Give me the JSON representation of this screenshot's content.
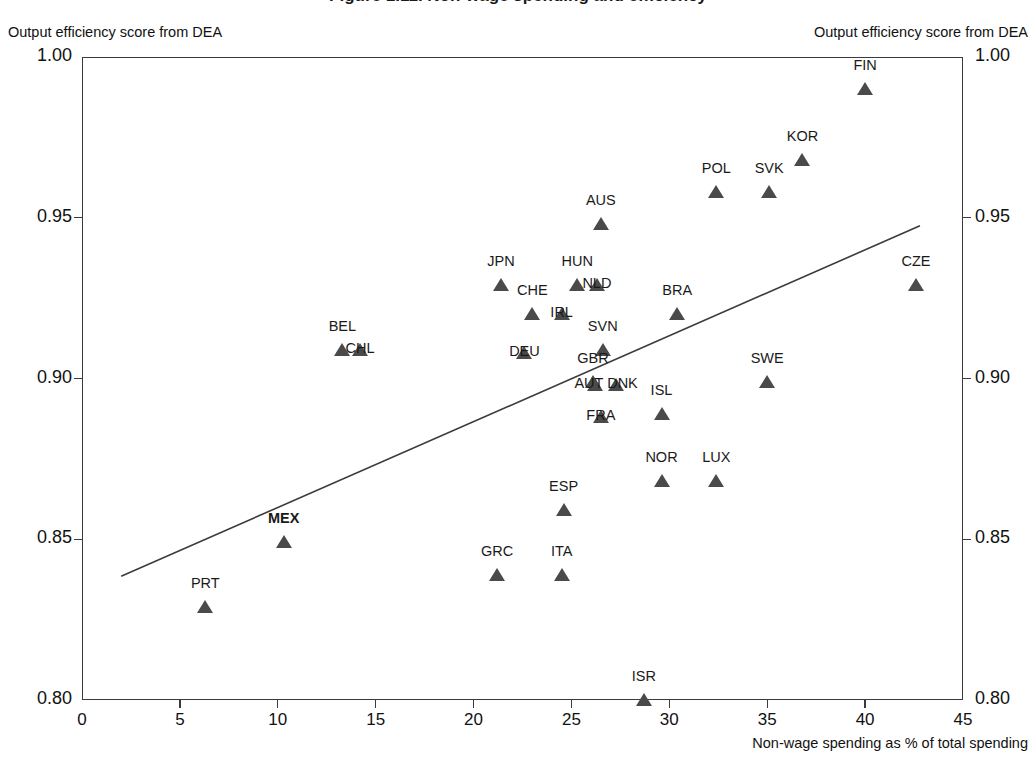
{
  "chart_data": {
    "type": "scatter",
    "title": "Figure 1.11. Non-wage spending and efficiency",
    "xlabel": "Non-wage spending as % of total spending",
    "ylabel_left": "Output efficiency score from DEA",
    "ylabel_right": "Output efficiency score from DEA",
    "xlim": [
      0,
      45
    ],
    "ylim": [
      0.8,
      1.0
    ],
    "xticks": [
      "0",
      "5",
      "10",
      "15",
      "20",
      "25",
      "30",
      "35",
      "40",
      "45"
    ],
    "xtick_values": [
      0,
      5,
      10,
      15,
      20,
      25,
      30,
      35,
      40,
      45
    ],
    "yticks": [
      "1.00",
      "0.95",
      "0.90",
      "0.85",
      "0.80"
    ],
    "ytick_values": [
      1.0,
      0.95,
      0.9,
      0.85,
      0.8
    ],
    "grid": false,
    "legend": "none",
    "marker": "triangle",
    "marker_color": "#4a4a4a",
    "highlight_country": "MEX",
    "trendline": {
      "type": "linear",
      "x0": 2.0,
      "y0": 0.8385,
      "x1": 42.8,
      "y1": 0.9475
    },
    "points": [
      {
        "label": "FIN",
        "x": 40.0,
        "y": 0.99,
        "label_dx": 0,
        "label_dy": -16
      },
      {
        "label": "KOR",
        "x": 36.8,
        "y": 0.968,
        "label_dx": 0,
        "label_dy": -16
      },
      {
        "label": "POL",
        "x": 32.4,
        "y": 0.958,
        "label_dx": 0,
        "label_dy": -16
      },
      {
        "label": "SVK",
        "x": 35.1,
        "y": 0.958,
        "label_dx": 0,
        "label_dy": -16
      },
      {
        "label": "AUS",
        "x": 26.5,
        "y": 0.948,
        "label_dx": 0,
        "label_dy": -16
      },
      {
        "label": "JPN",
        "x": 21.4,
        "y": 0.929,
        "label_dx": 0,
        "label_dy": -16
      },
      {
        "label": "HUN",
        "x": 25.3,
        "y": 0.929,
        "label_dx": 0,
        "label_dy": -16
      },
      {
        "label": "NLD",
        "x": 26.3,
        "y": 0.929,
        "label_dx": 0,
        "label_dy": 6
      },
      {
        "label": "CZE",
        "x": 42.6,
        "y": 0.929,
        "label_dx": 0,
        "label_dy": -16
      },
      {
        "label": "CHE",
        "x": 23.0,
        "y": 0.92,
        "label_dx": 0,
        "label_dy": -16
      },
      {
        "label": "BRA",
        "x": 30.4,
        "y": 0.92,
        "label_dx": 0,
        "label_dy": -16
      },
      {
        "label": "IRL",
        "x": 24.5,
        "y": 0.92,
        "label_dx": 0,
        "label_dy": 6
      },
      {
        "label": "SVN",
        "x": 26.6,
        "y": 0.909,
        "label_dx": 0,
        "label_dy": -16
      },
      {
        "label": "BEL",
        "x": 13.3,
        "y": 0.909,
        "label_dx": 0,
        "label_dy": -16
      },
      {
        "label": "CHL",
        "x": 14.2,
        "y": 0.909,
        "label_dx": 0,
        "label_dy": 6
      },
      {
        "label": "DEU",
        "x": 22.6,
        "y": 0.908,
        "label_dx": 0,
        "label_dy": 6
      },
      {
        "label": "GBR",
        "x": 26.1,
        "y": 0.899,
        "label_dx": 0,
        "label_dy": -16
      },
      {
        "label": "SWE",
        "x": 35.0,
        "y": 0.899,
        "label_dx": 0,
        "label_dy": -16
      },
      {
        "label": "AUT",
        "x": 26.2,
        "y": 0.898,
        "label_dx": -6,
        "label_dy": 6
      },
      {
        "label": "DNK",
        "x": 27.3,
        "y": 0.898,
        "label_dx": 6,
        "label_dy": 6
      },
      {
        "label": "ISL",
        "x": 29.6,
        "y": 0.889,
        "label_dx": 0,
        "label_dy": -16
      },
      {
        "label": "FRA",
        "x": 26.5,
        "y": 0.888,
        "label_dx": 0,
        "label_dy": 6
      },
      {
        "label": "NOR",
        "x": 29.6,
        "y": 0.868,
        "label_dx": 0,
        "label_dy": -16
      },
      {
        "label": "LUX",
        "x": 32.4,
        "y": 0.868,
        "label_dx": 0,
        "label_dy": -16
      },
      {
        "label": "ESP",
        "x": 24.6,
        "y": 0.859,
        "label_dx": 0,
        "label_dy": -16
      },
      {
        "label": "MEX",
        "x": 10.3,
        "y": 0.849,
        "label_dx": 0,
        "label_dy": -16,
        "bold": true
      },
      {
        "label": "GRC",
        "x": 21.2,
        "y": 0.839,
        "label_dx": 0,
        "label_dy": -16
      },
      {
        "label": "ITA",
        "x": 24.5,
        "y": 0.839,
        "label_dx": 0,
        "label_dy": -16
      },
      {
        "label": "PRT",
        "x": 6.3,
        "y": 0.829,
        "label_dx": 0,
        "label_dy": -16
      },
      {
        "label": "ISR",
        "x": 28.7,
        "y": 0.8,
        "label_dx": 0,
        "label_dy": -16
      }
    ]
  }
}
